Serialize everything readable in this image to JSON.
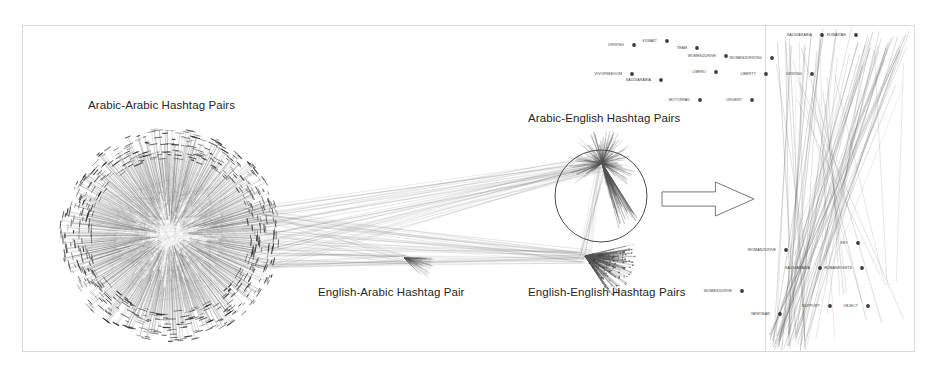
{
  "figure": {
    "title_alt": "Hashtag co-occurrence network",
    "background": "#ffffff",
    "frame_border_color": "#d9d9d9",
    "edge_color": "#555555",
    "node_color": "#1a1a1a",
    "highlight_circle_color": "#4a4a4a",
    "arrow_color": "#777777"
  },
  "cluster_labels": [
    {
      "id": "arabic-arabic",
      "text": "Arabic-Arabic Hashtag Pairs",
      "x": 88,
      "y": 105
    },
    {
      "id": "arabic-english",
      "text": "Arabic-English Hashtag Pairs",
      "x": 528,
      "y": 118
    },
    {
      "id": "english-arabic",
      "text": "English-Arabic Hashtag Pair",
      "x": 318,
      "y": 292
    },
    {
      "id": "english-english",
      "text": "English-English Hashtag Pairs",
      "x": 528,
      "y": 292
    }
  ],
  "clusters": {
    "arabic_arabic": {
      "cx": 170,
      "cy": 235,
      "radius": 106,
      "spokes": 560,
      "label_ref": "arabic-arabic"
    },
    "arabic_english": {
      "cx": 602,
      "cy": 163,
      "spokes": 150,
      "label_ref": "arabic-english"
    },
    "english_english": {
      "cx": 585,
      "cy": 256,
      "spokes": 190,
      "label_ref": "english-english"
    },
    "english_arabic": {
      "cx": 404,
      "cy": 258,
      "spokes": 60,
      "label_ref": "english-arabic"
    }
  },
  "highlight_circle": {
    "cx": 601,
    "cy": 196,
    "r": 46
  },
  "zoom_arrow": {
    "x": 662,
    "y": 182,
    "width": 92,
    "height": 34,
    "direction": "right"
  },
  "detail_panel": {
    "left": 766,
    "label": "zoomed detail of Arabic-English hashtag pairs",
    "nodes": [
      {
        "text": "DRIVING",
        "x": 634,
        "y": 45
      },
      {
        "text": "KUWAIT",
        "x": 667,
        "y": 41
      },
      {
        "text": "TEAM",
        "x": 697,
        "y": 48
      },
      {
        "text": "WOMEN2DRIVE",
        "x": 726,
        "y": 56
      },
      {
        "text": "WOMEN2DRIVING",
        "x": 772,
        "y": 58
      },
      {
        "text": "SAUDIARABIA",
        "x": 822,
        "y": 35
      },
      {
        "text": "KUWAITAH",
        "x": 856,
        "y": 35
      },
      {
        "text": "VIVOFREEDOM",
        "x": 632,
        "y": 74
      },
      {
        "text": "SAUDIARABIA",
        "x": 661,
        "y": 80
      },
      {
        "text": "LIBERO",
        "x": 716,
        "y": 72
      },
      {
        "text": "LIBERTY",
        "x": 766,
        "y": 74
      },
      {
        "text": "DRIVING",
        "x": 812,
        "y": 74
      },
      {
        "text": "MOTORPAD",
        "x": 700,
        "y": 100
      },
      {
        "text": "URGENT",
        "x": 752,
        "y": 100
      },
      {
        "text": "WOMAN2DRIVE",
        "x": 786,
        "y": 250
      },
      {
        "text": "KEY",
        "x": 858,
        "y": 243
      },
      {
        "text": "SAUDIARABIA",
        "x": 820,
        "y": 268
      },
      {
        "text": "HUMANRIGHTS",
        "x": 862,
        "y": 268
      },
      {
        "text": "WOMEN2DRIVE",
        "x": 742,
        "y": 291
      },
      {
        "text": "NEWYEAR",
        "x": 780,
        "y": 314
      },
      {
        "text": "SUPPORT",
        "x": 830,
        "y": 306
      },
      {
        "text": "OBJECT",
        "x": 868,
        "y": 306
      }
    ]
  }
}
